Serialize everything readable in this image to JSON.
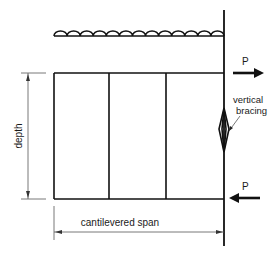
{
  "diagram": {
    "labels": {
      "top_force": "P",
      "bottom_force": "P",
      "bracing": "vertical\nbracing",
      "bracing_line1": "vertical",
      "bracing_line2": "bracing",
      "depth": "depth",
      "span": "cantilevered span"
    },
    "colors": {
      "line": "#111111",
      "dimension": "#555555",
      "background": "#ffffff"
    },
    "geometry": {
      "wall_x": 224,
      "top_chord_y": 73,
      "bottom_chord_y": 199,
      "left_x": 54,
      "verticals_x": [
        109,
        166
      ],
      "roof_y": 36,
      "scallop_count": 13
    }
  }
}
